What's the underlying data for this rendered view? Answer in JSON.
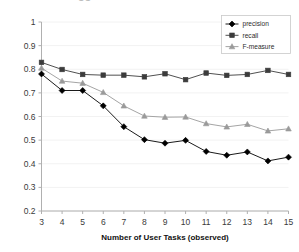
{
  "figure": {
    "clipped_title_fragment": "GG"
  },
  "chart_data": {
    "type": "line",
    "title": "",
    "xlabel": "Number of User Tasks (observed)",
    "ylabel": "",
    "x": [
      3,
      4,
      5,
      6,
      7,
      8,
      9,
      10,
      11,
      12,
      13,
      14,
      15
    ],
    "xtick_labels": [
      "3",
      "4",
      "5",
      "6",
      "7",
      "8",
      "9",
      "10",
      "11",
      "12",
      "13",
      "14",
      "15"
    ],
    "ytick_labels": [
      "0.2",
      "0.3",
      "0.4",
      "0.5",
      "0.6",
      "0.7",
      "0.8",
      "0.9",
      "1"
    ],
    "ytick_values": [
      0.2,
      0.3,
      0.4,
      0.5,
      0.6,
      0.7,
      0.8,
      0.9,
      1.0
    ],
    "ylim": [
      0.2,
      1.0
    ],
    "xlim": [
      3,
      15
    ],
    "grid": false,
    "legend_position": "top-right",
    "series": [
      {
        "name": "precision",
        "marker": "diamond",
        "color": "#000000",
        "values": [
          0.78,
          0.71,
          0.71,
          0.645,
          0.557,
          0.502,
          0.487,
          0.499,
          0.452,
          0.436,
          0.45,
          0.412,
          0.428
        ]
      },
      {
        "name": "recall",
        "marker": "square",
        "color": "#3c3c3c",
        "values": [
          0.829,
          0.799,
          0.778,
          0.775,
          0.775,
          0.768,
          0.781,
          0.756,
          0.784,
          0.774,
          0.778,
          0.795,
          0.778
        ]
      },
      {
        "name": "F-measure",
        "marker": "triangle",
        "color": "#9a9a9a",
        "values": [
          0.805,
          0.75,
          0.741,
          0.702,
          0.645,
          0.602,
          0.597,
          0.598,
          0.57,
          0.556,
          0.567,
          0.539,
          0.548
        ]
      }
    ]
  },
  "legend": {
    "items": [
      {
        "label": "precision"
      },
      {
        "label": "recall"
      },
      {
        "label": "F-measure"
      }
    ]
  }
}
